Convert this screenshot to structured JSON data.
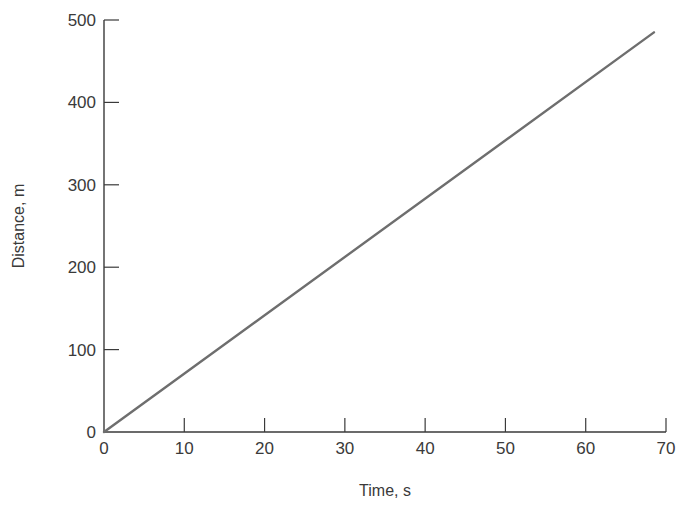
{
  "chart_data": {
    "type": "line",
    "title": "",
    "xlabel": "Time, s",
    "ylabel": "Distance, m",
    "xlim": [
      0,
      70
    ],
    "ylim": [
      0,
      500
    ],
    "x_ticks": [
      0,
      10,
      20,
      30,
      40,
      50,
      60,
      70
    ],
    "y_ticks": [
      0,
      100,
      200,
      300,
      400,
      500
    ],
    "grid": false,
    "legend": null,
    "series": [
      {
        "name": "distance",
        "x": [
          0,
          68.5
        ],
        "y": [
          0,
          485
        ],
        "color": "#6e6e6e"
      }
    ]
  },
  "colors": {
    "axis": "#3a3a3a",
    "line": "#6e6e6e",
    "background": "#ffffff"
  }
}
